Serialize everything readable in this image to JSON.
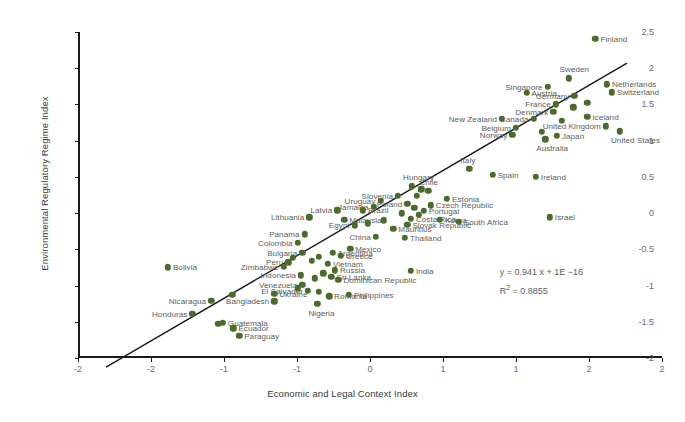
{
  "chart_data": {
    "type": "scatter",
    "title": "",
    "xlabel": "Economic and Legal Context Index",
    "ylabel": "Environmental Regulatory Regime Index",
    "xlim": [
      -2.5,
      2.5
    ],
    "ylim": [
      -2.0,
      2.5
    ],
    "xticks": [
      "-2",
      "-2",
      "-1",
      "-1",
      "0",
      "1",
      "1",
      "2",
      "2"
    ],
    "xtickvalues": [
      -2.5,
      -2,
      -1.5,
      -1,
      0,
      1,
      1.5,
      2,
      2.5
    ],
    "yticks": [
      "2.5",
      "2",
      "1.5",
      "1",
      "0.5",
      "0",
      "-0.5",
      "-1",
      "-1.5",
      "-2"
    ],
    "ytickvalues": [
      2.5,
      2,
      1.5,
      1,
      0.5,
      0,
      -0.5,
      -1,
      -1.5,
      -2
    ],
    "grid": false,
    "legend": false,
    "marker_color": "#4a6b2a",
    "label_color": "#5d5d5d",
    "trendline": {
      "slope": 0.941,
      "intercept": 0,
      "x_start": -2.26,
      "x_end": 2.2,
      "color": "#1a1a1a"
    },
    "annotations": {
      "equation": "y = 0.941 x + 1E −16",
      "r2_prefix": "R",
      "r2_sup": "2",
      "r2_value": " = 0.8855"
    },
    "points": [
      {
        "label": "Finland",
        "x": 1.93,
        "y": 2.41,
        "side": "right"
      },
      {
        "label": "Sweden",
        "x": 1.7,
        "y": 1.86,
        "side": "above"
      },
      {
        "label": "Netherlands",
        "x": 2.03,
        "y": 1.78,
        "side": "right"
      },
      {
        "label": "Singapore",
        "x": 1.52,
        "y": 1.74,
        "side": "left"
      },
      {
        "label": "Switzerland",
        "x": 2.07,
        "y": 1.67,
        "side": "right"
      },
      {
        "label": "Austria",
        "x": 1.34,
        "y": 1.66,
        "side": "right"
      },
      {
        "label": "Germany",
        "x": 1.75,
        "y": 1.62,
        "side": "left"
      },
      {
        "label": "France",
        "x": 1.59,
        "y": 1.5,
        "side": "left"
      },
      {
        "label": "Denmark",
        "x": 1.57,
        "y": 1.4,
        "side": "left"
      },
      {
        "label": "Iceland",
        "x": 1.86,
        "y": 1.33,
        "side": "right"
      },
      {
        "label": "New Zealand",
        "x": 1.13,
        "y": 1.3,
        "side": "left"
      },
      {
        "label": "Canada",
        "x": 1.4,
        "y": 1.3,
        "side": "left"
      },
      {
        "label": "United Kingdom",
        "x": 2.02,
        "y": 1.2,
        "side": "left"
      },
      {
        "label": "Belgium",
        "x": 1.25,
        "y": 1.18,
        "side": "left"
      },
      {
        "label": "United States",
        "x": 2.14,
        "y": 1.13,
        "side": "below"
      },
      {
        "label": "Norway",
        "x": 1.22,
        "y": 1.08,
        "side": "left"
      },
      {
        "label": "Japan",
        "x": 1.6,
        "y": 1.07,
        "side": "right"
      },
      {
        "label": "Australia",
        "x": 1.5,
        "y": 1.02,
        "side": "below"
      },
      {
        "label": "Italy",
        "x": 0.85,
        "y": 0.61,
        "side": "above"
      },
      {
        "label": "Spain",
        "x": 1.05,
        "y": 0.53,
        "side": "right"
      },
      {
        "label": "Ireland",
        "x": 1.42,
        "y": 0.5,
        "side": "right"
      },
      {
        "label": "Hungary",
        "x": 0.36,
        "y": 0.37,
        "side": "above"
      },
      {
        "label": "Chile",
        "x": 0.5,
        "y": 0.31,
        "side": "above"
      },
      {
        "label": "Slovenia",
        "x": 0.24,
        "y": 0.24,
        "side": "left"
      },
      {
        "label": "Estonia",
        "x": 0.66,
        "y": 0.2,
        "side": "right"
      },
      {
        "label": "Uruguay",
        "x": 0.09,
        "y": 0.17,
        "side": "left"
      },
      {
        "label": "Poland",
        "x": 0.32,
        "y": 0.13,
        "side": "left"
      },
      {
        "label": "Czech Republic",
        "x": 0.52,
        "y": 0.11,
        "side": "right"
      },
      {
        "label": "Jamaica",
        "x": 0.03,
        "y": 0.09,
        "side": "left"
      },
      {
        "label": "Latvia",
        "x": -0.28,
        "y": 0.04,
        "side": "left"
      },
      {
        "label": "Brazil",
        "x": -0.06,
        "y": 0.04,
        "side": "right"
      },
      {
        "label": "Portugal",
        "x": 0.46,
        "y": 0.03,
        "side": "right"
      },
      {
        "label": "Israel",
        "x": 1.54,
        "y": -0.06,
        "side": "right"
      },
      {
        "label": "Malaysia",
        "x": -0.22,
        "y": -0.09,
        "side": "right"
      },
      {
        "label": "Lithuania",
        "x": -0.52,
        "y": -0.06,
        "side": "left"
      },
      {
        "label": "Costa Rica",
        "x": 0.35,
        "y": -0.08,
        "side": "right"
      },
      {
        "label": "Korea",
        "x": 0.6,
        "y": -0.09,
        "side": "right"
      },
      {
        "label": "South Africa",
        "x": 0.76,
        "y": -0.12,
        "side": "right"
      },
      {
        "label": "Egypt",
        "x": -0.13,
        "y": -0.17,
        "side": "left"
      },
      {
        "label": "Slovak Republic",
        "x": 0.32,
        "y": -0.16,
        "side": "right"
      },
      {
        "label": "Mauritius",
        "x": 0.2,
        "y": -0.22,
        "side": "right"
      },
      {
        "label": "Panama",
        "x": -0.56,
        "y": -0.29,
        "side": "left"
      },
      {
        "label": "China",
        "x": 0.05,
        "y": -0.33,
        "side": "left"
      },
      {
        "label": "Thailand",
        "x": 0.3,
        "y": -0.34,
        "side": "right"
      },
      {
        "label": "Colombia",
        "x": -0.62,
        "y": -0.41,
        "side": "left"
      },
      {
        "label": "Mexico",
        "x": -0.17,
        "y": -0.49,
        "side": "right"
      },
      {
        "label": "Bulgaria",
        "x": -0.58,
        "y": -0.55,
        "side": "left"
      },
      {
        "label": "Argentina",
        "x": -0.32,
        "y": -0.55,
        "side": "right"
      },
      {
        "label": "Greece",
        "x": -0.25,
        "y": -0.59,
        "side": "right"
      },
      {
        "label": "Bolivia",
        "x": -1.73,
        "y": -0.75,
        "side": "right"
      },
      {
        "label": "Peru",
        "x": -0.7,
        "y": -0.68,
        "side": "left"
      },
      {
        "label": "Vietnam",
        "x": -0.36,
        "y": -0.7,
        "side": "right"
      },
      {
        "label": "Zimbabwe",
        "x": -0.74,
        "y": -0.74,
        "side": "left"
      },
      {
        "label": "India",
        "x": 0.35,
        "y": -0.8,
        "side": "right"
      },
      {
        "label": "Russia",
        "x": -0.3,
        "y": -0.79,
        "side": "right"
      },
      {
        "label": "Indonesia",
        "x": -0.59,
        "y": -0.86,
        "side": "left"
      },
      {
        "label": "Sri Lanka",
        "x": -0.33,
        "y": -0.88,
        "side": "right"
      },
      {
        "label": "Dominican Republic",
        "x": -0.27,
        "y": -0.92,
        "side": "right"
      },
      {
        "label": "Venezuela",
        "x": -0.58,
        "y": -0.99,
        "side": "left"
      },
      {
        "label": "Nicaragua",
        "x": -1.36,
        "y": -1.21,
        "side": "left"
      },
      {
        "label": "El Salvador",
        "x": -0.53,
        "y": -1.07,
        "side": "left"
      },
      {
        "label": "Philippines",
        "x": -0.18,
        "y": -1.13,
        "side": "right"
      },
      {
        "label": "Ukraine",
        "x": -0.82,
        "y": -1.11,
        "side": "right"
      },
      {
        "label": "Romania",
        "x": -0.35,
        "y": -1.15,
        "side": "right"
      },
      {
        "label": "Bangladesh",
        "x": -0.82,
        "y": -1.22,
        "side": "left"
      },
      {
        "label": "Nigeria",
        "x": -0.45,
        "y": -1.25,
        "side": "below"
      },
      {
        "label": "Honduras",
        "x": -1.52,
        "y": -1.39,
        "side": "left"
      },
      {
        "label": "Guatemala",
        "x": -1.26,
        "y": -1.51,
        "side": "right"
      },
      {
        "label": "Ecuador",
        "x": -1.17,
        "y": -1.59,
        "side": "right"
      },
      {
        "label": "Paraguay",
        "x": -1.12,
        "y": -1.69,
        "side": "right"
      },
      {
        "label": "",
        "x": 1.86,
        "y": 1.52,
        "side": "none"
      },
      {
        "label": "",
        "x": 1.74,
        "y": 1.46,
        "side": "none"
      },
      {
        "label": "",
        "x": 1.64,
        "y": 1.27,
        "side": "none"
      },
      {
        "label": "",
        "x": 1.47,
        "y": 1.12,
        "side": "none"
      },
      {
        "label": "",
        "x": 0.44,
        "y": 0.33,
        "side": "none"
      },
      {
        "label": "",
        "x": 0.4,
        "y": 0.24,
        "side": "none"
      },
      {
        "label": "",
        "x": 0.38,
        "y": 0.07,
        "side": "none"
      },
      {
        "label": "",
        "x": 0.42,
        "y": -0.02,
        "side": "none"
      },
      {
        "label": "",
        "x": 0.27,
        "y": 0.0,
        "side": "none"
      },
      {
        "label": "",
        "x": 0.12,
        "y": -0.1,
        "side": "none"
      },
      {
        "label": "",
        "x": -0.02,
        "y": -0.14,
        "side": "none"
      },
      {
        "label": "",
        "x": -0.44,
        "y": -0.6,
        "side": "none"
      },
      {
        "label": "",
        "x": -0.5,
        "y": -0.66,
        "side": "none"
      },
      {
        "label": "",
        "x": -0.66,
        "y": -0.62,
        "side": "none"
      },
      {
        "label": "",
        "x": -0.4,
        "y": -0.83,
        "side": "none"
      },
      {
        "label": "",
        "x": -0.47,
        "y": -0.9,
        "side": "none"
      },
      {
        "label": "",
        "x": -0.62,
        "y": -1.04,
        "side": "none"
      },
      {
        "label": "",
        "x": -0.44,
        "y": -1.09,
        "side": "none"
      },
      {
        "label": "",
        "x": -1.18,
        "y": -1.13,
        "side": "none"
      },
      {
        "label": "",
        "x": -1.3,
        "y": -1.53,
        "side": "none"
      }
    ]
  }
}
